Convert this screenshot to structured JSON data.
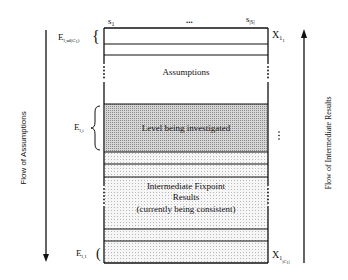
{
  "diagram": {
    "column_labels": {
      "first": "s",
      "first_sub": "1",
      "ellipsis": "...",
      "last": "s",
      "last_sub": "|S|"
    },
    "left_labels": {
      "top": "E",
      "top_sub": "l,sd(C",
      "top_sub2": "1",
      "top_sub_close": ")",
      "middle": "E",
      "middle_sub": "l,i",
      "bottom": "E",
      "bottom_sub": "l,1"
    },
    "right_labels": {
      "top": "X",
      "top_sub": "1",
      "top_sub2": "1",
      "bottom": "X",
      "bottom_sub": "1",
      "bottom_sub2": "|C",
      "bottom_sub3": "1",
      "bottom_sub4": "|"
    },
    "sections": {
      "assumptions": "Assumptions",
      "level": "Level being investigated",
      "fixpoint_line1": "Intermediate Fixpoint",
      "fixpoint_line2": "Results",
      "fixpoint_line3": "(currently being consistent)"
    },
    "arrows": {
      "left": "Flow of Assumptions",
      "right": "Flow of Intermediate Results"
    },
    "colors": {
      "line": "#111111",
      "level_fill": "#c4c4c4",
      "fixpoint_fill": "#ebebeb"
    }
  }
}
